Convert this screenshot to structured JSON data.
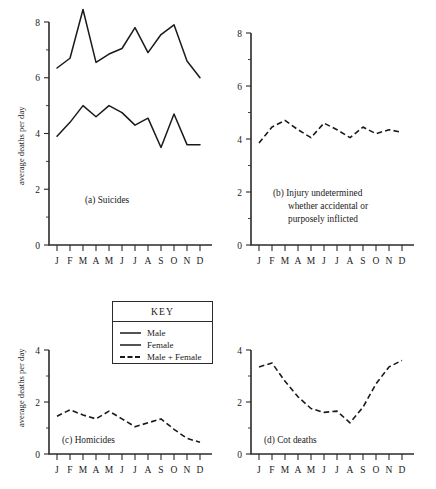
{
  "figure": {
    "y_axis_title": "average deaths per day",
    "months": [
      "J",
      "F",
      "M",
      "A",
      "M",
      "J",
      "J",
      "A",
      "S",
      "O",
      "N",
      "D"
    ]
  },
  "legend": {
    "title": "KEY",
    "items": [
      {
        "label": "Male",
        "style": "solid"
      },
      {
        "label": "Female",
        "style": "solid"
      },
      {
        "label": "Male + Female",
        "style": "dashed"
      }
    ]
  },
  "panels": {
    "a": {
      "caption": "(a)  Suicides",
      "y_ticks": [
        "0",
        "2",
        "4",
        "6",
        "8"
      ]
    },
    "b": {
      "caption_line1": "(b)  Injury undetermined",
      "caption_line2": "whether accidental or",
      "caption_line3": "purposely inflicted",
      "y_ticks": [
        "0",
        "2",
        "4",
        "6",
        "8"
      ]
    },
    "c": {
      "caption": "(c)  Homicides",
      "y_ticks": [
        "0",
        "2",
        "4"
      ]
    },
    "d": {
      "caption": "(d)  Cot deaths",
      "y_ticks": [
        "0",
        "2",
        "4"
      ]
    }
  },
  "chart_data": [
    {
      "type": "line",
      "title": "(a)  Suicides",
      "xlabel": "",
      "ylabel": "average deaths per day",
      "categories": [
        "J",
        "F",
        "M",
        "A",
        "M",
        "J",
        "J",
        "A",
        "S",
        "O",
        "N",
        "D"
      ],
      "ylim": [
        0,
        8
      ],
      "yticks": [
        0,
        2,
        4,
        6,
        8
      ],
      "grid": false,
      "legend_position": "external-key-box",
      "series": [
        {
          "name": "Male",
          "style": "solid",
          "values": [
            6.35,
            6.7,
            8.45,
            6.55,
            6.85,
            7.05,
            7.8,
            6.9,
            7.55,
            7.9,
            6.6,
            6.0
          ]
        },
        {
          "name": "Female",
          "style": "solid",
          "values": [
            3.9,
            4.4,
            5.0,
            4.6,
            5.0,
            4.75,
            4.3,
            4.55,
            3.5,
            4.7,
            3.6,
            3.6
          ]
        }
      ]
    },
    {
      "type": "line",
      "title": "(b)  Injury undetermined whether accidental or purposely inflicted",
      "xlabel": "",
      "ylabel": "average deaths per day",
      "categories": [
        "J",
        "F",
        "M",
        "A",
        "M",
        "J",
        "J",
        "A",
        "S",
        "O",
        "N",
        "D"
      ],
      "ylim": [
        0,
        8
      ],
      "yticks": [
        0,
        2,
        4,
        6,
        8
      ],
      "grid": false,
      "series": [
        {
          "name": "Male + Female",
          "style": "dashed",
          "values": [
            3.85,
            4.45,
            4.7,
            4.35,
            4.05,
            4.6,
            4.35,
            4.05,
            4.45,
            4.2,
            4.35,
            4.25
          ]
        }
      ]
    },
    {
      "type": "line",
      "title": "(c)  Homicides",
      "xlabel": "",
      "ylabel": "average deaths per day",
      "categories": [
        "J",
        "F",
        "M",
        "A",
        "M",
        "J",
        "J",
        "A",
        "S",
        "O",
        "N",
        "D"
      ],
      "ylim": [
        0,
        4
      ],
      "yticks": [
        0,
        2,
        4
      ],
      "grid": false,
      "series": [
        {
          "name": "Male + Female",
          "style": "dashed",
          "values": [
            1.45,
            1.7,
            1.5,
            1.35,
            1.65,
            1.35,
            1.05,
            1.2,
            1.35,
            0.95,
            0.6,
            0.45
          ]
        }
      ]
    },
    {
      "type": "line",
      "title": "(d)  Cot deaths",
      "xlabel": "",
      "ylabel": "",
      "categories": [
        "J",
        "F",
        "M",
        "A",
        "M",
        "J",
        "J",
        "A",
        "S",
        "O",
        "N",
        "D"
      ],
      "ylim": [
        0,
        4
      ],
      "yticks": [
        0,
        2,
        4
      ],
      "grid": false,
      "series": [
        {
          "name": "Male + Female",
          "style": "dashed",
          "values": [
            3.35,
            3.5,
            2.8,
            2.2,
            1.75,
            1.6,
            1.65,
            1.2,
            1.8,
            2.7,
            3.35,
            3.6
          ]
        }
      ]
    }
  ]
}
